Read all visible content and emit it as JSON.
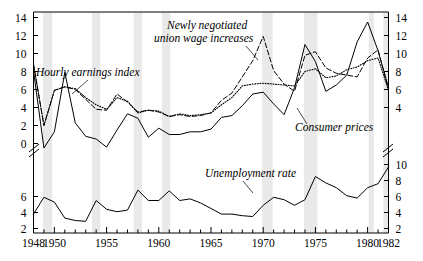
{
  "chart_data": {
    "type": "line",
    "title": "",
    "subtitle": "",
    "xlabel": "",
    "ylabel": "",
    "xlim": [
      1948,
      1982
    ],
    "grid": false,
    "legend": "inline-annotations",
    "axis_break": true,
    "panels": [
      {
        "name": "upper-panel",
        "ylim": [
          3,
          14
        ],
        "ylabel": "percent change",
        "yticks": [
          4,
          6,
          8,
          10,
          12,
          14
        ],
        "ytick_labels": [
          "4",
          "6",
          "8",
          "10",
          "12",
          "14"
        ],
        "left_extra_ticks": [
          0,
          2
        ],
        "left_extra_tick_labels": [
          "0",
          "2"
        ],
        "left_ylim": [
          -1,
          14
        ]
      },
      {
        "name": "lower-panel",
        "ylim": [
          2,
          11
        ],
        "ylabel": "percent",
        "yticks_left": [
          2,
          4,
          6
        ],
        "ytick_labels_left": [
          "2",
          "4",
          "6"
        ],
        "yticks_right": [
          2,
          4,
          6,
          8,
          10
        ],
        "ytick_labels_right": [
          "2",
          "4",
          "6",
          "8",
          "10"
        ]
      }
    ],
    "xticks_major": [
      1948,
      1950,
      1955,
      1960,
      1965,
      1970,
      1975,
      1980,
      1982
    ],
    "xtick_labels": [
      "1948",
      "1950",
      "1955",
      "1960",
      "1965",
      "1970",
      "1975",
      "1980",
      "1982"
    ],
    "years": [
      1948,
      1949,
      1950,
      1951,
      1952,
      1953,
      1954,
      1955,
      1956,
      1957,
      1958,
      1959,
      1960,
      1961,
      1962,
      1963,
      1964,
      1965,
      1966,
      1967,
      1968,
      1969,
      1970,
      1971,
      1972,
      1973,
      1974,
      1975,
      1976,
      1977,
      1978,
      1979,
      1980,
      1981,
      1982
    ],
    "series": [
      {
        "name": "Hourly earnings index",
        "style": "dotted",
        "panel": "upper-panel",
        "label": "Hourly earnings index",
        "values": [
          8.8,
          2.0,
          5.9,
          6.3,
          6.1,
          5.1,
          4.3,
          3.8,
          5.1,
          4.7,
          3.4,
          3.7,
          3.6,
          3.0,
          3.3,
          3.1,
          3.2,
          3.4,
          4.3,
          5.1,
          6.4,
          6.6,
          6.7,
          6.6,
          6.5,
          6.4,
          8.0,
          8.3,
          7.3,
          7.5,
          8.2,
          8.5,
          9.2,
          9.5,
          5.9
        ]
      },
      {
        "name": "Newly negotiated union wage increases",
        "style": "dashed",
        "panel": "upper-panel",
        "label": "Newly negotiated union wage increases",
        "values": [
          8.8,
          2.0,
          5.9,
          6.3,
          6.0,
          4.9,
          3.8,
          3.7,
          5.5,
          4.6,
          3.5,
          3.7,
          3.5,
          3.0,
          3.2,
          3.0,
          3.1,
          3.4,
          4.8,
          5.6,
          7.4,
          9.2,
          11.9,
          8.1,
          6.6,
          5.8,
          9.8,
          10.2,
          8.4,
          7.8,
          7.6,
          7.4,
          9.5,
          10.4,
          6.0
        ]
      },
      {
        "name": "Consumer prices",
        "style": "solid",
        "panel": "upper-panel",
        "label": "Consumer prices",
        "values": [
          8.1,
          -1.2,
          1.3,
          7.9,
          2.3,
          0.8,
          0.5,
          -0.4,
          1.5,
          3.3,
          2.8,
          0.7,
          1.7,
          1.0,
          1.0,
          1.3,
          1.3,
          1.6,
          2.9,
          3.1,
          4.2,
          5.5,
          5.7,
          4.4,
          3.2,
          6.2,
          11.0,
          9.1,
          5.8,
          6.5,
          7.6,
          11.3,
          13.5,
          10.3,
          6.2
        ]
      },
      {
        "name": "Unemployment rate",
        "style": "solid",
        "panel": "lower-panel",
        "label": "Unemployment rate",
        "values": [
          3.8,
          5.9,
          5.3,
          3.3,
          3.0,
          2.9,
          5.5,
          4.4,
          4.1,
          4.3,
          6.8,
          5.5,
          5.5,
          6.7,
          5.5,
          5.7,
          5.2,
          4.5,
          3.8,
          3.8,
          3.6,
          3.5,
          4.9,
          5.9,
          5.6,
          4.9,
          5.6,
          8.5,
          7.7,
          7.1,
          6.1,
          5.8,
          7.1,
          7.6,
          9.7
        ]
      }
    ],
    "recession_bands": [
      {
        "start": 1948.9,
        "end": 1949.8
      },
      {
        "start": 1953.6,
        "end": 1954.4
      },
      {
        "start": 1957.6,
        "end": 1958.4
      },
      {
        "start": 1960.3,
        "end": 1961.1
      },
      {
        "start": 1969.9,
        "end": 1970.9
      },
      {
        "start": 1973.9,
        "end": 1975.2
      },
      {
        "start": 1980.1,
        "end": 1980.6
      },
      {
        "start": 1981.5,
        "end": 1982.0
      }
    ],
    "annotations": [
      {
        "name": "hourly-earnings-index",
        "text": "Hourly earnings index"
      },
      {
        "name": "newly-negotiated-union-wage-increases",
        "text": "Newly negotiated"
      },
      {
        "name": "newly-negotiated-union-wage-increases-2",
        "text": "union wage increases"
      },
      {
        "name": "consumer-prices",
        "text": "Consumer prices"
      },
      {
        "name": "unemployment-rate",
        "text": "Unemployment rate"
      }
    ]
  },
  "axes": {
    "left_upper_labels": [
      "14",
      "12",
      "10",
      "8",
      "6",
      "4",
      "2",
      "0"
    ],
    "left_lower_labels": [
      "6",
      "4",
      "2"
    ],
    "right_upper_labels": [
      "14",
      "12",
      "10",
      "8",
      "6",
      "4"
    ],
    "right_lower_labels": [
      "10",
      "8",
      "6",
      "4",
      "2"
    ],
    "x_labels": [
      "1948",
      "1950",
      "1955",
      "1960",
      "1965",
      "1970",
      "1975",
      "1980",
      "1982"
    ]
  },
  "colors": {
    "ink": "#000000",
    "band": "#e9e9e9",
    "background": "#ffffff"
  }
}
